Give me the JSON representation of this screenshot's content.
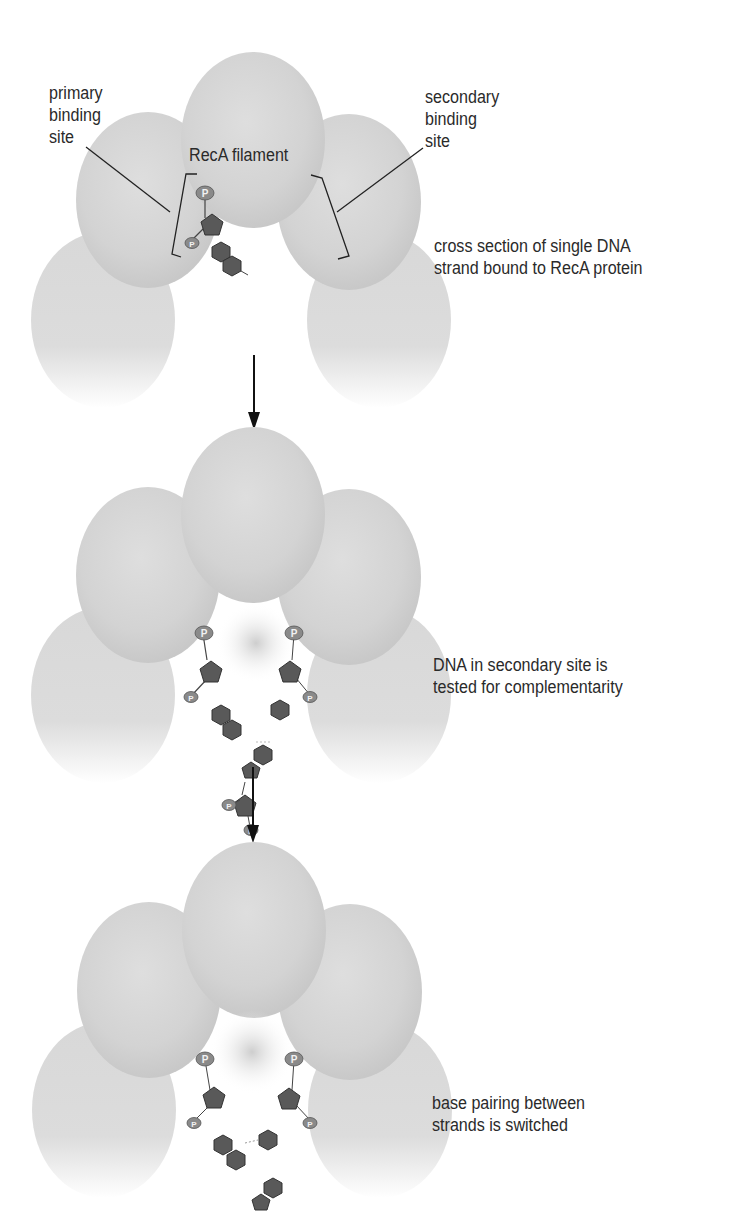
{
  "figure": {
    "panels": [
      {
        "id": "step-1",
        "title_label": "RecA filament",
        "left_annotation": [
          "primary",
          "binding",
          "site"
        ],
        "right_annotation": [
          "secondary",
          "binding",
          "site"
        ],
        "caption": [
          "cross section of single DNA",
          "strand bound to RecA protein"
        ]
      },
      {
        "id": "step-2",
        "caption": [
          "DNA in secondary site is",
          "tested for complementarity"
        ]
      },
      {
        "id": "step-3",
        "caption": [
          "base pairing between",
          "strands is switched"
        ]
      }
    ],
    "phosphate_symbol": "P",
    "colors": {
      "protein_subunit": "#d9d9d9",
      "protein_shadow": "#c4c4c4",
      "nucleotide": "#595959",
      "phosphate": "#8a8a8a",
      "arrow": "#111111",
      "text": "#2a2a2a"
    }
  }
}
